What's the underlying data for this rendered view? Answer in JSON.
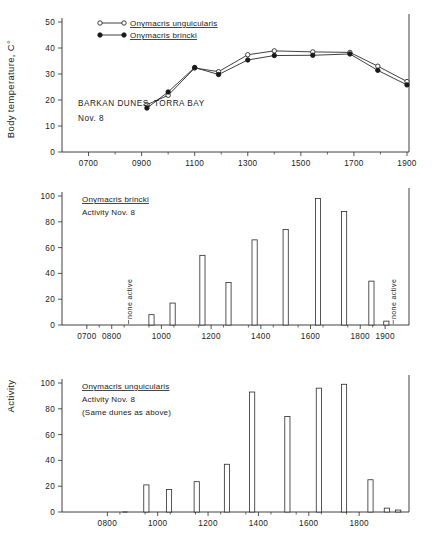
{
  "figure": {
    "y_axis_label_top": "Body temperature, C°",
    "y_axis_label_bars": "Activity"
  },
  "chart_data": [
    {
      "type": "line",
      "panel": "top",
      "title": "",
      "xlabel": "",
      "ylabel": "Body temperature, C°",
      "ylim": [
        0,
        50
      ],
      "yticks": [
        0,
        10,
        20,
        30,
        40,
        50
      ],
      "xlim": [
        600,
        1900
      ],
      "xticks": [
        700,
        900,
        1100,
        1300,
        1500,
        1700,
        1900
      ],
      "xticklabels": [
        "0700",
        "0900",
        "1100",
        "1300",
        "1500",
        "1700",
        "1900"
      ],
      "grid": false,
      "legend_position": "upper-left",
      "annotations": [
        "BARKAN DUNES, TORRA BAY",
        "Nov. 8"
      ],
      "series": [
        {
          "name": "Onymacris unguicularis",
          "marker": "open-circle",
          "x": [
            920,
            1000,
            1100,
            1190,
            1300,
            1400,
            1545,
            1685,
            1790,
            1900
          ],
          "values": [
            18.2,
            21.8,
            32.3,
            30.9,
            37.4,
            38.9,
            38.5,
            38.3,
            33.0,
            27.1
          ]
        },
        {
          "name": "Onymacris brincki",
          "marker": "filled-circle",
          "x": [
            920,
            1000,
            1100,
            1190,
            1300,
            1400,
            1545,
            1685,
            1790,
            1900
          ],
          "values": [
            16.9,
            23.1,
            32.5,
            29.8,
            35.4,
            37.1,
            37.2,
            37.7,
            31.4,
            25.8
          ]
        }
      ]
    },
    {
      "type": "bar",
      "panel": "middle",
      "title": "Onymacris brincki",
      "subtitle": "Activity Nov. 8",
      "xlabel": "",
      "ylabel": "Activity",
      "ylim": [
        0,
        100
      ],
      "yticks": [
        0,
        20,
        40,
        60,
        80,
        100
      ],
      "xlim": [
        600,
        1960
      ],
      "xticks": [
        700,
        800,
        1000,
        1200,
        1400,
        1600,
        1800,
        1900
      ],
      "xticklabels": [
        "0700",
        "0800",
        "1000",
        "1200",
        "1400",
        "1600",
        "1800",
        "1900"
      ],
      "grid": false,
      "x": [
        960,
        1045,
        1165,
        1270,
        1375,
        1500,
        1630,
        1735,
        1845,
        1905
      ],
      "values": [
        8,
        17,
        54,
        33,
        66,
        74,
        98,
        88,
        34,
        3
      ],
      "annotations": [
        {
          "text": "none active",
          "x": 880,
          "orientation": "vertical"
        },
        {
          "text": "none active",
          "x": 1945,
          "orientation": "vertical"
        }
      ]
    },
    {
      "type": "bar",
      "panel": "bottom",
      "title": "Onymacris unguicularis",
      "subtitle": "Activity Nov. 8",
      "note": "(Same dunes as above)",
      "xlabel": "",
      "ylabel": "Activity",
      "ylim": [
        0,
        100
      ],
      "yticks": [
        0,
        20,
        40,
        60,
        80,
        100
      ],
      "xlim": [
        620,
        1990
      ],
      "xticks": [
        800,
        1000,
        1200,
        1400,
        1600,
        1800
      ],
      "xticklabels": [
        "0800",
        "1000",
        "1200",
        "1400",
        "1600",
        "1800"
      ],
      "grid": false,
      "x": [
        870,
        955,
        1045,
        1155,
        1275,
        1375,
        1515,
        1640,
        1740,
        1845,
        1910,
        1955
      ],
      "values": [
        0.6,
        21,
        17.5,
        23.5,
        37,
        93,
        74,
        96,
        99,
        25,
        3,
        1.5
      ]
    }
  ]
}
